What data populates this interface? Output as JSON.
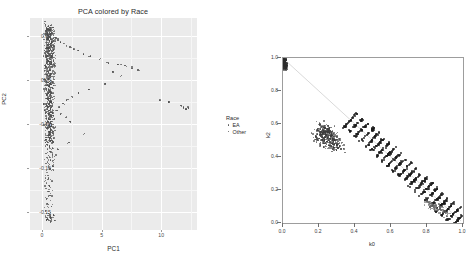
{
  "figure": {
    "left": {
      "title": "PCA colored by Race",
      "xlabel": "PC1",
      "ylabel": "PC2",
      "xticks": [
        "0",
        "5",
        "10"
      ],
      "yticks": [
        "0.05",
        "0.00",
        "-0.05",
        "-0.10",
        "-0.15"
      ],
      "legend": {
        "title": "Race",
        "items": [
          {
            "label": "EA",
            "color": "#555555"
          },
          {
            "label": "Other",
            "color": "#555555"
          }
        ]
      },
      "panel_bg": "#ebebeb",
      "grid_color": "#ffffff",
      "point_color": "#4a4a4a"
    },
    "right": {
      "xlabel": "k0",
      "ylabel": "k2",
      "xticks": [
        "0.0",
        "0.2",
        "0.4",
        "0.6",
        "0.8",
        "1.0"
      ],
      "yticks": [
        "0.0",
        "0.2",
        "0.4",
        "0.6",
        "0.8",
        "1.0"
      ],
      "panel_bg": "#ffffff",
      "border_color": "#9d9d9d",
      "point_color": "#333333",
      "line_color": "#b9b9b9"
    }
  },
  "chart_data": [
    {
      "type": "scatter",
      "title": "PCA colored by Race",
      "xlabel": "PC1",
      "ylabel": "PC2",
      "xlim": [
        -0.02,
        0.26
      ],
      "ylim": [
        -0.17,
        0.07
      ],
      "grid": true,
      "legend": {
        "position": "right",
        "title": "Race",
        "entries": [
          "EA",
          "Other"
        ]
      },
      "series": [
        {
          "name": "EA",
          "color": "#4a4a4a",
          "description": "Three dense vertical clusters near PC1 ~ 0.01 spanning PC2 0.05 down to -0.09",
          "points": [
            [
              0.01,
              0.062
            ],
            [
              0.012,
              0.06
            ],
            [
              0.009,
              0.058
            ],
            [
              0.013,
              0.057
            ],
            [
              0.011,
              0.055
            ],
            [
              0.008,
              0.054
            ],
            [
              0.014,
              0.053
            ],
            [
              0.01,
              0.051
            ],
            [
              0.012,
              0.05
            ],
            [
              0.009,
              0.048
            ],
            [
              0.013,
              0.047
            ],
            [
              0.011,
              0.045
            ],
            [
              0.015,
              0.044
            ],
            [
              0.008,
              0.043
            ],
            [
              0.012,
              0.041
            ],
            [
              0.01,
              0.04
            ],
            [
              0.014,
              0.039
            ],
            [
              0.009,
              0.037
            ],
            [
              0.013,
              0.036
            ],
            [
              0.011,
              0.034
            ],
            [
              0.016,
              0.033
            ],
            [
              0.01,
              0.031
            ],
            [
              0.012,
              0.03
            ],
            [
              0.009,
              0.028
            ],
            [
              0.014,
              0.027
            ],
            [
              0.011,
              0.025
            ],
            [
              0.013,
              0.024
            ],
            [
              0.01,
              0.022
            ],
            [
              0.012,
              0.021
            ],
            [
              0.015,
              0.019
            ],
            [
              0.009,
              0.018
            ],
            [
              0.013,
              0.016
            ],
            [
              0.011,
              0.014
            ],
            [
              0.012,
              0.012
            ],
            [
              0.01,
              0.01
            ],
            [
              0.014,
              0.008
            ],
            [
              0.011,
              0.006
            ],
            [
              0.012,
              0.004
            ],
            [
              0.01,
              0.002
            ],
            [
              0.013,
              0.0
            ],
            [
              0.009,
              -0.002
            ],
            [
              0.012,
              -0.004
            ],
            [
              0.011,
              -0.006
            ],
            [
              0.014,
              -0.008
            ],
            [
              0.01,
              -0.01
            ],
            [
              0.012,
              -0.012
            ],
            [
              0.009,
              -0.014
            ],
            [
              0.013,
              -0.016
            ],
            [
              0.011,
              -0.018
            ],
            [
              0.012,
              -0.02
            ],
            [
              0.01,
              -0.022
            ],
            [
              0.014,
              -0.024
            ],
            [
              0.011,
              -0.026
            ],
            [
              0.012,
              -0.028
            ],
            [
              0.009,
              -0.03
            ],
            [
              0.013,
              -0.032
            ],
            [
              0.011,
              -0.034
            ],
            [
              0.012,
              -0.036
            ],
            [
              0.01,
              -0.038
            ],
            [
              0.014,
              -0.04
            ],
            [
              0.011,
              -0.042
            ],
            [
              0.012,
              -0.044
            ],
            [
              0.009,
              -0.046
            ],
            [
              0.013,
              -0.048
            ],
            [
              0.011,
              -0.05
            ],
            [
              0.012,
              -0.052
            ],
            [
              0.01,
              -0.054
            ],
            [
              0.014,
              -0.056
            ],
            [
              0.011,
              -0.058
            ],
            [
              0.012,
              -0.06
            ],
            [
              0.009,
              -0.062
            ],
            [
              0.013,
              -0.064
            ],
            [
              0.011,
              -0.066
            ],
            [
              0.012,
              -0.068
            ],
            [
              0.01,
              -0.07
            ],
            [
              0.011,
              -0.075
            ],
            [
              0.012,
              -0.08
            ],
            [
              0.01,
              -0.085
            ],
            [
              0.013,
              -0.09
            ],
            [
              0.011,
              -0.095
            ],
            [
              0.012,
              -0.1
            ],
            [
              0.01,
              -0.11
            ],
            [
              0.011,
              -0.12
            ],
            [
              0.012,
              -0.13
            ],
            [
              0.01,
              -0.14
            ],
            [
              0.012,
              -0.152
            ],
            [
              0.014,
              -0.155
            ],
            [
              0.01,
              -0.157
            ],
            [
              0.013,
              -0.154
            ]
          ]
        },
        {
          "name": "Other",
          "color": "#4a4a4a",
          "description": "Scattered admixed individuals trailing toward high PC1",
          "points": [
            [
              0.022,
              0.048
            ],
            [
              0.026,
              0.046
            ],
            [
              0.03,
              0.044
            ],
            [
              0.035,
              0.042
            ],
            [
              0.04,
              0.04
            ],
            [
              0.046,
              0.038
            ],
            [
              0.052,
              0.036
            ],
            [
              0.06,
              0.034
            ],
            [
              0.068,
              0.03
            ],
            [
              0.08,
              0.028
            ],
            [
              0.095,
              0.024
            ],
            [
              0.11,
              0.02
            ],
            [
              0.126,
              0.018
            ],
            [
              0.132,
              0.018
            ],
            [
              0.138,
              0.017
            ],
            [
              0.15,
              0.014
            ],
            [
              0.16,
              0.012
            ],
            [
              0.118,
              0.01
            ],
            [
              0.132,
              0.006
            ],
            [
              0.104,
              -0.004
            ],
            [
              0.078,
              -0.01
            ],
            [
              0.06,
              -0.014
            ],
            [
              0.048,
              -0.018
            ],
            [
              0.04,
              -0.022
            ],
            [
              0.034,
              -0.026
            ],
            [
              0.028,
              -0.03
            ],
            [
              0.024,
              -0.034
            ],
            [
              0.03,
              -0.038
            ],
            [
              0.038,
              -0.042
            ],
            [
              0.046,
              -0.046
            ],
            [
              0.196,
              -0.022
            ],
            [
              0.212,
              -0.024
            ],
            [
              0.232,
              -0.028
            ],
            [
              0.236,
              -0.03
            ],
            [
              0.24,
              -0.032
            ],
            [
              0.244,
              -0.031
            ],
            [
              0.07,
              -0.06
            ],
            [
              0.044,
              -0.07
            ],
            [
              0.026,
              -0.078
            ],
            [
              0.02,
              -0.086
            ]
          ]
        }
      ]
    },
    {
      "type": "scatter",
      "title": "",
      "xlabel": "k0",
      "ylabel": "k2",
      "xlim": [
        0.0,
        1.0
      ],
      "ylim": [
        0.0,
        1.0
      ],
      "grid": false,
      "annotations": [
        "Dense blob at (0.0, 1.0)",
        "Faint gray guide line from (0.0,1.0) toward (1.0,0.0)",
        "Dense black band along k0 + k2 = 1 from about (0.37,0.63) to (1.0,0.0)",
        "Diffuse cluster centered near (0.25, 0.55)",
        "Sub-cluster near (0.82, 0.12)"
      ],
      "series": [
        {
          "name": "corner-blob",
          "color": "#2b2b2b",
          "points": [
            [
              0.0,
              1.0
            ],
            [
              0.004,
              0.996
            ],
            [
              0.002,
              0.992
            ],
            [
              0.006,
              0.988
            ],
            [
              0.003,
              0.984
            ],
            [
              0.008,
              0.98
            ],
            [
              0.001,
              0.976
            ],
            [
              0.005,
              0.972
            ],
            [
              0.007,
              0.968
            ],
            [
              0.002,
              0.964
            ],
            [
              0.004,
              0.96
            ],
            [
              0.006,
              0.956
            ],
            [
              0.003,
              0.952
            ],
            [
              0.009,
              0.948
            ],
            [
              0.005,
              0.944
            ]
          ]
        },
        {
          "name": "mid-cluster",
          "color": "#3a3a3a",
          "points": [
            [
              0.2,
              0.6
            ],
            [
              0.21,
              0.59
            ],
            [
              0.22,
              0.585
            ],
            [
              0.23,
              0.58
            ],
            [
              0.24,
              0.575
            ],
            [
              0.25,
              0.57
            ],
            [
              0.26,
              0.565
            ],
            [
              0.27,
              0.56
            ],
            [
              0.215,
              0.572
            ],
            [
              0.225,
              0.566
            ],
            [
              0.235,
              0.56
            ],
            [
              0.245,
              0.555
            ],
            [
              0.255,
              0.55
            ],
            [
              0.265,
              0.545
            ],
            [
              0.275,
              0.54
            ],
            [
              0.19,
              0.565
            ],
            [
              0.205,
              0.558
            ],
            [
              0.218,
              0.55
            ],
            [
              0.232,
              0.545
            ],
            [
              0.248,
              0.538
            ],
            [
              0.262,
              0.532
            ],
            [
              0.278,
              0.528
            ],
            [
              0.292,
              0.522
            ],
            [
              0.186,
              0.545
            ],
            [
              0.2,
              0.538
            ],
            [
              0.214,
              0.532
            ],
            [
              0.228,
              0.526
            ],
            [
              0.242,
              0.52
            ],
            [
              0.256,
              0.515
            ],
            [
              0.27,
              0.51
            ],
            [
              0.284,
              0.505
            ],
            [
              0.298,
              0.5
            ],
            [
              0.18,
              0.525
            ],
            [
              0.196,
              0.518
            ],
            [
              0.212,
              0.512
            ],
            [
              0.226,
              0.506
            ],
            [
              0.24,
              0.5
            ],
            [
              0.254,
              0.494
            ],
            [
              0.268,
              0.488
            ],
            [
              0.282,
              0.483
            ],
            [
              0.296,
              0.478
            ],
            [
              0.31,
              0.472
            ],
            [
              0.205,
              0.492
            ],
            [
              0.222,
              0.486
            ],
            [
              0.238,
              0.48
            ],
            [
              0.252,
              0.474
            ],
            [
              0.266,
              0.468
            ],
            [
              0.28,
              0.462
            ],
            [
              0.3,
              0.456
            ],
            [
              0.318,
              0.452
            ]
          ]
        },
        {
          "name": "admixture-line",
          "color": "#1a1a1a",
          "description": "Dense band where k0 + k2 approximately equals 1",
          "points": [
            [
              0.37,
              0.63
            ],
            [
              0.4,
              0.6
            ],
            [
              0.43,
              0.57
            ],
            [
              0.46,
              0.54
            ],
            [
              0.49,
              0.51
            ],
            [
              0.52,
              0.48
            ],
            [
              0.55,
              0.45
            ],
            [
              0.58,
              0.42
            ],
            [
              0.61,
              0.39
            ],
            [
              0.64,
              0.36
            ],
            [
              0.67,
              0.33
            ],
            [
              0.7,
              0.3
            ],
            [
              0.73,
              0.27
            ],
            [
              0.76,
              0.24
            ],
            [
              0.79,
              0.21
            ],
            [
              0.82,
              0.18
            ],
            [
              0.85,
              0.15
            ],
            [
              0.88,
              0.12
            ],
            [
              0.91,
              0.09
            ],
            [
              0.94,
              0.06
            ],
            [
              0.97,
              0.03
            ],
            [
              1.0,
              0.0
            ]
          ]
        },
        {
          "name": "lower-right-cluster",
          "color": "#6a6a6a",
          "points": [
            [
              0.8,
              0.13
            ],
            [
              0.812,
              0.122
            ],
            [
              0.824,
              0.116
            ],
            [
              0.836,
              0.11
            ],
            [
              0.848,
              0.104
            ],
            [
              0.806,
              0.118
            ],
            [
              0.818,
              0.11
            ],
            [
              0.83,
              0.104
            ],
            [
              0.842,
              0.098
            ],
            [
              0.854,
              0.092
            ],
            [
              0.862,
              0.086
            ],
            [
              0.874,
              0.08
            ],
            [
              0.886,
              0.072
            ],
            [
              0.898,
              0.064
            ],
            [
              0.91,
              0.056
            ]
          ]
        }
      ]
    }
  ]
}
